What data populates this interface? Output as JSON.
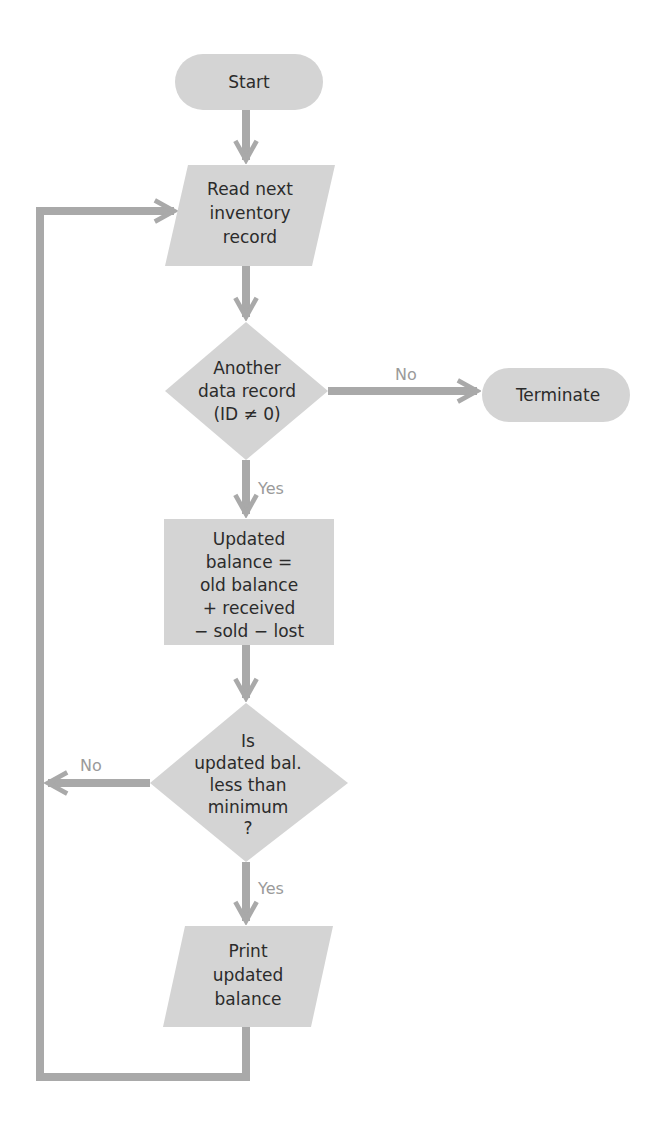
{
  "diagram": {
    "type": "flowchart",
    "colors": {
      "shape_fill": "#d4d4d4",
      "connector": "#a9a9a9",
      "text": "#2b2b2b",
      "edge_label": "#9a9a9a",
      "background": "#ffffff"
    },
    "nodes": {
      "start": {
        "shape": "terminator",
        "lines": [
          "Start"
        ]
      },
      "read": {
        "shape": "parallelogram",
        "lines": [
          "Read next",
          "inventory",
          "record"
        ]
      },
      "decision1": {
        "shape": "diamond",
        "lines": [
          "Another",
          "data record",
          "(ID ≠ 0)"
        ]
      },
      "terminate": {
        "shape": "terminator",
        "lines": [
          "Terminate"
        ]
      },
      "process": {
        "shape": "rectangle",
        "lines": [
          "Updated",
          "balance =",
          "old balance",
          "+ received",
          "− sold − lost"
        ]
      },
      "decision2": {
        "shape": "diamond",
        "lines": [
          "Is",
          "updated bal.",
          "less than",
          "minimum",
          "?"
        ]
      },
      "print": {
        "shape": "parallelogram",
        "lines": [
          "Print",
          "updated",
          "balance"
        ]
      }
    },
    "edges": {
      "d1_no": "No",
      "d1_yes": "Yes",
      "d2_no": "No",
      "d2_yes": "Yes"
    }
  }
}
